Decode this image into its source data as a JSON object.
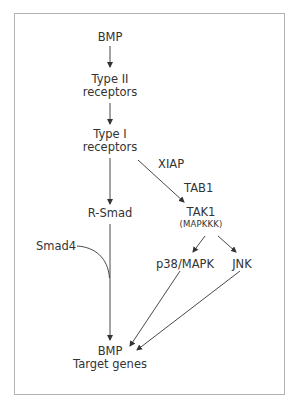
{
  "diagram": {
    "nodes": {
      "bmp": {
        "label": "BMP"
      },
      "type2": {
        "line1": "Type II",
        "line2": "receptors"
      },
      "type1": {
        "line1": "Type I",
        "line2": "receptors"
      },
      "xiap": {
        "label": "XIAP"
      },
      "tab1": {
        "label": "TAB1"
      },
      "rsmad": {
        "label": "R-Smad"
      },
      "tak1": {
        "label": "TAK1",
        "sublabel": "(MAPKKK)"
      },
      "smad4": {
        "label": "Smad4"
      },
      "p38": {
        "label": "p38/MAPK"
      },
      "jnk": {
        "label": "JNK"
      },
      "target": {
        "line1": "BMP",
        "line2": "Target genes"
      }
    },
    "edges": [
      {
        "from": "BMP",
        "to": "Type II receptors"
      },
      {
        "from": "Type II receptors",
        "to": "Type I receptors"
      },
      {
        "from": "Type I receptors",
        "to": "R-Smad"
      },
      {
        "from": "Type I receptors",
        "to": "TAK1 (MAPKKK)",
        "via": [
          "XIAP",
          "TAB1"
        ]
      },
      {
        "from": "TAK1 (MAPKKK)",
        "to": "p38/MAPK"
      },
      {
        "from": "TAK1 (MAPKKK)",
        "to": "JNK"
      },
      {
        "from": "R-Smad",
        "to": "BMP Target genes",
        "joined_by": "Smad4"
      },
      {
        "from": "p38/MAPK",
        "to": "BMP Target genes"
      },
      {
        "from": "JNK",
        "to": "BMP Target genes"
      }
    ],
    "colors": {
      "text": "#333333",
      "line": "#333333",
      "frame": "#b3b3b3"
    }
  }
}
